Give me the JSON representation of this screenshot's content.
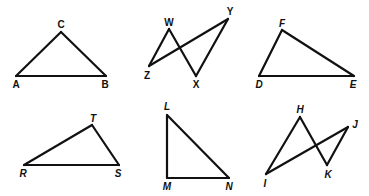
{
  "figures": [
    {
      "name": "triangle-ABC",
      "vertices": {
        "A": [
          16,
          76
        ],
        "B": [
          106,
          76
        ],
        "C": [
          61,
          32
        ]
      },
      "edges": [
        [
          "A",
          "B"
        ],
        [
          "B",
          "C"
        ],
        [
          "C",
          "A"
        ]
      ],
      "labels": [
        {
          "text": "C",
          "x": 61,
          "y": 28
        },
        {
          "text": "A",
          "x": 16,
          "y": 88
        },
        {
          "text": "B",
          "x": 105,
          "y": 88
        }
      ]
    },
    {
      "name": "bowtie-WXYZ",
      "vertices": {
        "W": [
          169,
          29
        ],
        "X": [
          196,
          76
        ],
        "Y": [
          228,
          19
        ],
        "Z": [
          149,
          66
        ]
      },
      "edges": [
        [
          "Z",
          "W"
        ],
        [
          "W",
          "X"
        ],
        [
          "X",
          "Y"
        ],
        [
          "Y",
          "Z"
        ]
      ],
      "labels": [
        {
          "text": "W",
          "x": 169,
          "y": 26
        },
        {
          "text": "Y",
          "x": 230,
          "y": 15
        },
        {
          "text": "Z",
          "x": 147,
          "y": 79
        },
        {
          "text": "X",
          "x": 196,
          "y": 88
        }
      ]
    },
    {
      "name": "triangle-DEF",
      "vertices": {
        "D": [
          259,
          76
        ],
        "E": [
          354,
          76
        ],
        "F": [
          282,
          30
        ]
      },
      "edges": [
        [
          "D",
          "E"
        ],
        [
          "E",
          "F"
        ],
        [
          "F",
          "D"
        ]
      ],
      "labels": [
        {
          "text": "F",
          "x": 282,
          "y": 27,
          "italic": true
        },
        {
          "text": "D",
          "x": 259,
          "y": 88,
          "italic": true
        },
        {
          "text": "E",
          "x": 353,
          "y": 88,
          "italic": true
        }
      ]
    },
    {
      "name": "triangle-RST",
      "vertices": {
        "R": [
          24,
          165
        ],
        "S": [
          119,
          165
        ],
        "T": [
          92,
          125
        ]
      },
      "edges": [
        [
          "R",
          "S"
        ],
        [
          "S",
          "T"
        ],
        [
          "T",
          "R"
        ]
      ],
      "labels": [
        {
          "text": "T",
          "x": 93,
          "y": 122,
          "italic": true
        },
        {
          "text": "R",
          "x": 23,
          "y": 177,
          "italic": true
        },
        {
          "text": "S",
          "x": 118,
          "y": 177,
          "italic": true
        }
      ]
    },
    {
      "name": "triangle-LMN",
      "vertices": {
        "L": [
          167,
          115
        ],
        "M": [
          167,
          178
        ],
        "N": [
          229,
          178
        ]
      },
      "edges": [
        [
          "L",
          "M"
        ],
        [
          "M",
          "N"
        ],
        [
          "N",
          "L"
        ]
      ],
      "labels": [
        {
          "text": "L",
          "x": 167,
          "y": 110,
          "italic": true
        },
        {
          "text": "M",
          "x": 167,
          "y": 190,
          "italic": true
        },
        {
          "text": "N",
          "x": 229,
          "y": 190,
          "italic": true
        }
      ]
    },
    {
      "name": "bowtie-HIJK",
      "vertices": {
        "H": [
          300,
          117
        ],
        "I": [
          266,
          174
        ],
        "J": [
          348,
          127
        ],
        "K": [
          327,
          165
        ]
      },
      "edges": [
        [
          "I",
          "H"
        ],
        [
          "H",
          "K"
        ],
        [
          "K",
          "J"
        ],
        [
          "J",
          "I"
        ]
      ],
      "labels": [
        {
          "text": "H",
          "x": 300,
          "y": 113,
          "italic": true
        },
        {
          "text": "J",
          "x": 355,
          "y": 128,
          "italic": true
        },
        {
          "text": "K",
          "x": 328,
          "y": 178,
          "italic": true
        },
        {
          "text": "I",
          "x": 265,
          "y": 187,
          "italic": true
        }
      ]
    }
  ]
}
